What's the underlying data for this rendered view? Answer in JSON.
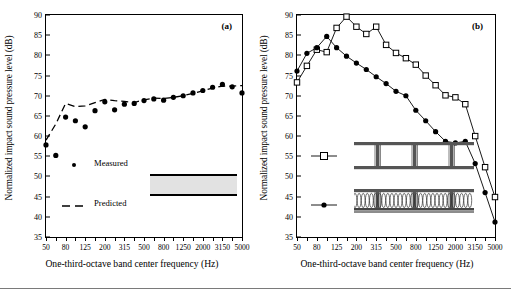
{
  "figure": {
    "bottom_rule": true,
    "panels": [
      {
        "tag": "(a)",
        "xlabel": "One-third-octave band center frequency (Hz)",
        "ylabel": "Normalized impact sound pressure level (dB)",
        "legend": [
          {
            "label": "Measured",
            "marker": "filled-circle"
          },
          {
            "label": "Predicted",
            "marker": "dashed-line"
          }
        ],
        "assembly_note": "concrete-slab-diagram"
      },
      {
        "tag": "(b)",
        "xlabel": "One-third-octave band center frequency (Hz)",
        "ylabel": "Normalized impact sound pressure level (dB)",
        "legend": [
          {
            "label": "",
            "marker": "open-square"
          },
          {
            "label": "",
            "marker": "filled-circle"
          }
        ],
        "assembly_note": "joist-floor-diagrams"
      }
    ]
  },
  "chart_data": [
    {
      "type": "line",
      "title": "(a)",
      "xlabel": "One-third-octave band center frequency (Hz)",
      "ylabel": "Normalized impact sound pressure level (dB)",
      "xlim": [
        0,
        20
      ],
      "ylim": [
        35,
        90
      ],
      "yticks": [
        35,
        40,
        45,
        50,
        55,
        60,
        65,
        70,
        75,
        80,
        85,
        90
      ],
      "xticks": [
        50,
        80,
        125,
        200,
        315,
        500,
        800,
        1250,
        2000,
        3150,
        5000
      ],
      "x_bands": [
        50,
        63,
        80,
        100,
        125,
        160,
        200,
        250,
        315,
        400,
        500,
        630,
        800,
        1000,
        1250,
        1600,
        2000,
        2500,
        3150,
        4000,
        5000
      ],
      "grid": false,
      "legend_position": "lower-left",
      "series": [
        {
          "name": "Measured",
          "marker": "filled-circle",
          "style": "points",
          "x": [
            50,
            63,
            80,
            100,
            125,
            160,
            200,
            250,
            315,
            400,
            500,
            630,
            800,
            1000,
            1250,
            1600,
            2000,
            2500,
            3150,
            4000,
            5000
          ],
          "values": [
            57.8,
            55.2,
            64.7,
            63.8,
            62.3,
            66.3,
            68.5,
            66.5,
            67.9,
            68.1,
            68.8,
            69.2,
            68.9,
            69.6,
            70.0,
            70.7,
            71.3,
            72.1,
            72.8,
            72.2,
            70.7
          ]
        },
        {
          "name": "Predicted",
          "marker": "dashed-line",
          "style": "dashed",
          "x": [
            50,
            63,
            80,
            100,
            125,
            160,
            200,
            250,
            315,
            400,
            500,
            630,
            800,
            1000,
            1250,
            1600,
            2000,
            2500,
            3150,
            4000,
            5000
          ],
          "values": [
            59.0,
            63.0,
            68.1,
            67.3,
            67.5,
            68.3,
            69.1,
            68.8,
            68.6,
            68.3,
            69.0,
            69.4,
            69.3,
            69.6,
            70.0,
            70.6,
            71.2,
            71.9,
            72.4,
            72.4,
            72.5
          ]
        }
      ]
    },
    {
      "type": "line",
      "title": "(b)",
      "xlabel": "One-third-octave band center frequency (Hz)",
      "ylabel": "Normalized impact sound pressure level (dB)",
      "xlim": [
        0,
        20
      ],
      "ylim": [
        35,
        90
      ],
      "yticks": [
        35,
        40,
        45,
        50,
        55,
        60,
        65,
        70,
        75,
        80,
        85,
        90
      ],
      "xticks": [
        50,
        80,
        125,
        200,
        315,
        500,
        800,
        1250,
        2000,
        3150,
        5000
      ],
      "x_bands": [
        50,
        63,
        80,
        100,
        125,
        160,
        200,
        250,
        315,
        400,
        500,
        630,
        800,
        1000,
        1250,
        1600,
        2000,
        2500,
        3150,
        4000,
        5000
      ],
      "grid": false,
      "legend_position": "lower-left",
      "series": [
        {
          "name": "bare-joist-floor",
          "marker": "open-square",
          "style": "solid",
          "x": [
            50,
            63,
            80,
            100,
            125,
            160,
            200,
            250,
            315,
            400,
            500,
            630,
            800,
            1000,
            1250,
            1600,
            2000,
            2500,
            3150,
            4000,
            5000
          ],
          "values": [
            73.3,
            77.4,
            81.4,
            80.8,
            86.8,
            89.6,
            87.1,
            85.3,
            87.1,
            82.6,
            80.6,
            79.3,
            77.7,
            75.0,
            72.6,
            70.1,
            69.6,
            67.9,
            60.0,
            52.3,
            44.9
          ]
        },
        {
          "name": "joist-floor-with-insulation",
          "marker": "filled-circle",
          "style": "solid",
          "x": [
            50,
            63,
            80,
            100,
            125,
            160,
            200,
            250,
            315,
            400,
            500,
            630,
            800,
            1000,
            1250,
            1600,
            2000,
            2500,
            3150,
            4000,
            5000
          ],
          "values": [
            76.1,
            80.5,
            81.9,
            84.7,
            81.9,
            79.8,
            78.1,
            76.5,
            74.7,
            73.0,
            71.1,
            70.0,
            66.4,
            63.8,
            61.1,
            58.7,
            58.3,
            58.7,
            53.2,
            46.0,
            38.7
          ]
        }
      ]
    }
  ]
}
